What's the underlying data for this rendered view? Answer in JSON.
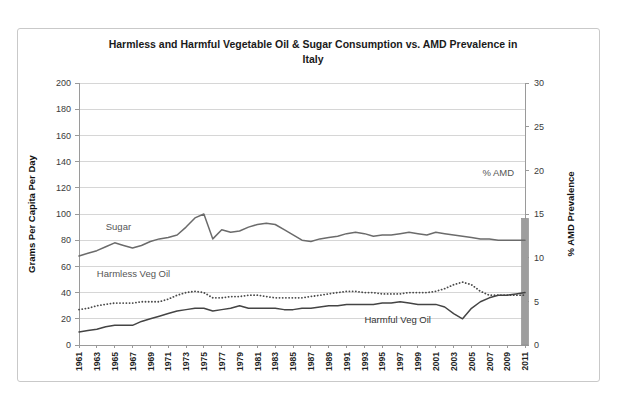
{
  "chart_data": {
    "type": "line",
    "title": "Harmless and Harmful Vegetable Oil & Sugar Consumption vs. AMD Prevalence in Italy",
    "title_line1": "Harmless and Harmful Vegetable Oil & Sugar Consumption vs. AMD Prevalence in",
    "title_line2": "Italy",
    "xlabel": "",
    "ylabel": "Grams Per Capita Per Day",
    "y2label": "% AMD Prevalence",
    "ylim": [
      0,
      200
    ],
    "y2lim": [
      0,
      30
    ],
    "ytick_step": 20,
    "y2tick_step": 5,
    "grid": true,
    "legend_position": "inline-annotations",
    "yticks": [
      0,
      20,
      40,
      60,
      80,
      100,
      120,
      140,
      160,
      180,
      200
    ],
    "y2ticks": [
      0,
      5,
      10,
      15,
      20,
      25,
      30
    ],
    "x": [
      1961,
      1962,
      1963,
      1964,
      1965,
      1966,
      1967,
      1968,
      1969,
      1970,
      1971,
      1972,
      1973,
      1974,
      1975,
      1976,
      1977,
      1978,
      1979,
      1980,
      1981,
      1982,
      1983,
      1984,
      1985,
      1986,
      1987,
      1988,
      1989,
      1990,
      1991,
      1992,
      1993,
      1994,
      1995,
      1996,
      1997,
      1998,
      1999,
      2000,
      2001,
      2002,
      2003,
      2004,
      2005,
      2006,
      2007,
      2008,
      2009,
      2010,
      2011
    ],
    "xticks": [
      1961,
      1963,
      1965,
      1967,
      1969,
      1971,
      1973,
      1975,
      1977,
      1979,
      1981,
      1983,
      1985,
      1987,
      1989,
      1991,
      1993,
      1995,
      1997,
      1999,
      2001,
      2003,
      2005,
      2007,
      2009,
      2011
    ],
    "series": [
      {
        "name": "Sugar",
        "label": "Sugar",
        "style": "solid",
        "color": "#6b6b6b",
        "axis": "left",
        "label_x": 1964,
        "label_y": 88,
        "values": [
          68,
          70,
          72,
          75,
          78,
          76,
          74,
          76,
          79,
          81,
          82,
          84,
          90,
          97,
          100,
          81,
          88,
          86,
          87,
          90,
          92,
          93,
          92,
          88,
          84,
          80,
          79,
          81,
          82,
          83,
          85,
          86,
          85,
          83,
          84,
          84,
          85,
          86,
          85,
          84,
          86,
          85,
          84,
          83,
          82,
          81,
          81,
          80,
          80,
          80,
          80
        ]
      },
      {
        "name": "Harmless Veg Oil",
        "label": "Harmless Veg Oil",
        "style": "dotted",
        "color": "#4a4a4a",
        "axis": "left",
        "label_x": 1963,
        "label_y": 52,
        "values": [
          27,
          28,
          30,
          31,
          32,
          32,
          32,
          33,
          33,
          33,
          35,
          38,
          40,
          41,
          40,
          36,
          36,
          37,
          37,
          38,
          38,
          37,
          36,
          36,
          36,
          36,
          37,
          38,
          39,
          40,
          41,
          41,
          40,
          40,
          39,
          39,
          39,
          40,
          40,
          40,
          41,
          43,
          46,
          48,
          46,
          41,
          38,
          38,
          38,
          38,
          38
        ]
      },
      {
        "name": "Harmful Veg Oil",
        "label": "Harmful Veg Oil",
        "style": "solid",
        "color": "#444444",
        "axis": "left",
        "label_x": 1993,
        "label_y": 17,
        "values": [
          10,
          11,
          12,
          14,
          15,
          15,
          15,
          18,
          20,
          22,
          24,
          26,
          27,
          28,
          28,
          26,
          27,
          28,
          30,
          28,
          28,
          28,
          28,
          27,
          27,
          28,
          28,
          29,
          30,
          30,
          31,
          31,
          31,
          31,
          32,
          32,
          33,
          32,
          31,
          31,
          31,
          29,
          24,
          20,
          28,
          33,
          36,
          38,
          38,
          39,
          40
        ]
      }
    ],
    "bar_series": {
      "name": "% AMD",
      "label": "% AMD",
      "color": "#9e9e9e",
      "axis": "right",
      "label_x": 2008,
      "label_y": 129,
      "year": 2011,
      "value": 14.5
    }
  }
}
